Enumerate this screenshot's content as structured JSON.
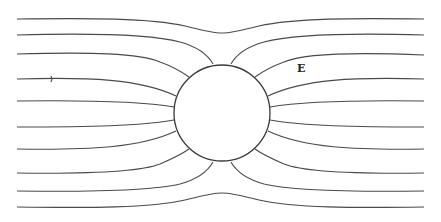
{
  "diagram": {
    "field_label": "E",
    "line_color": "#4a4a4a",
    "sphere": {
      "cx": 222,
      "cy": 113,
      "r": 48
    },
    "field_lines_y_at_edges": [
      19,
      35,
      54,
      79,
      101,
      127,
      149,
      173,
      191,
      207
    ],
    "arrow_marker": {
      "x": 51,
      "y": 79
    }
  }
}
